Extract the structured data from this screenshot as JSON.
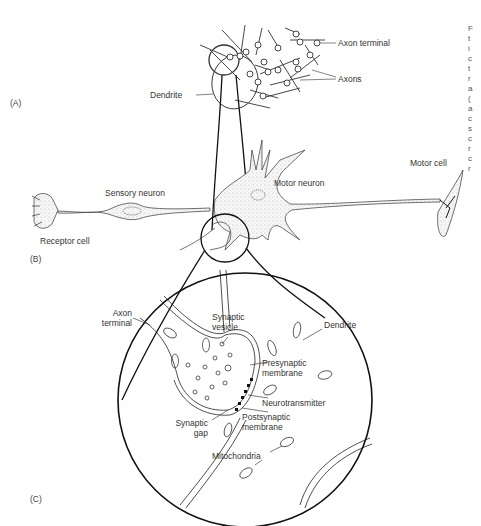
{
  "figure": {
    "panels": {
      "a": "(A)",
      "b": "(B)",
      "c": "(C)"
    },
    "panel_a_labels": {
      "axon_terminal": "Axon terminal",
      "axons": "Axons",
      "dendrite": "Dendrite"
    },
    "panel_b_labels": {
      "sensory_neuron": "Sensory neuron",
      "receptor_cell": "Receptor cell",
      "motor_neuron": "Motor neuron",
      "motor_cell": "Motor cell"
    },
    "panel_c_labels": {
      "axon_terminal_line1": "Axon",
      "axon_terminal_line2": "terminal",
      "synaptic_vesicle_line1": "Synaptic",
      "synaptic_vesicle_line2": "vesicle",
      "dendrite": "Dendrite",
      "presynaptic_line1": "Presynaptic",
      "presynaptic_line2": "membrane",
      "neurotransmitter": "Neurotransmitter",
      "postsynaptic_line1": "Postsynaptic",
      "postsynaptic_line2": "membrane",
      "synaptic_gap_line1": "Synaptic",
      "synaptic_gap_line2": "gap",
      "mitochondria": "Mitochondria"
    },
    "cropped_edge_text": [
      "F",
      "t",
      "i",
      "c",
      "t",
      "r",
      "a",
      "(",
      "a",
      "c",
      "s",
      "c",
      "r",
      "c",
      "r"
    ]
  }
}
